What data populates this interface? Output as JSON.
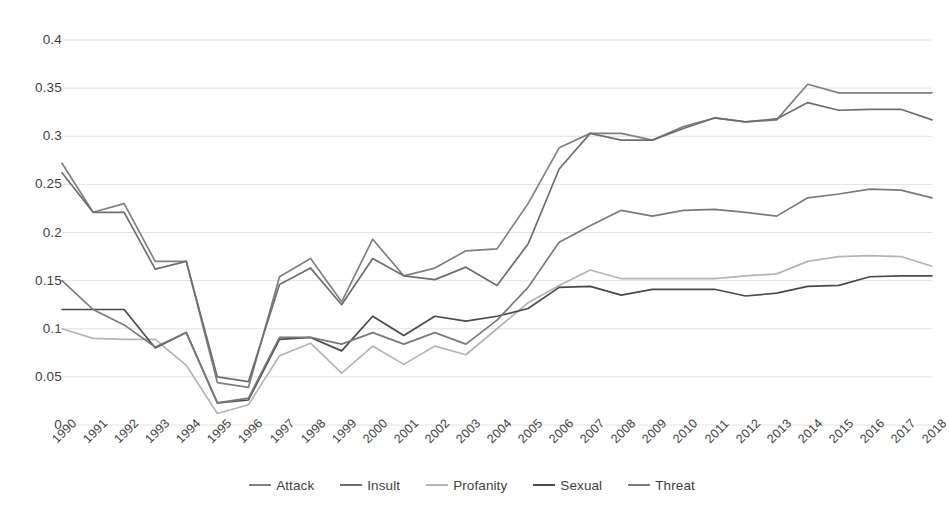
{
  "chart_data": {
    "type": "line",
    "title": "",
    "subtitle": "",
    "xlabel": "",
    "ylabel": "",
    "grid": true,
    "legend_position": "bottom",
    "xlim": [
      1990,
      2018
    ],
    "ylim": [
      0,
      0.4
    ],
    "ytick_labels": [
      "0",
      "0.05",
      "0.1",
      "0.15",
      "0.2",
      "0.25",
      "0.3",
      "0.35",
      "0.4"
    ],
    "ytick_values": [
      0,
      0.05,
      0.1,
      0.15,
      0.2,
      0.25,
      0.3,
      0.35,
      0.4
    ],
    "categories": [
      "1990",
      "1991",
      "1992",
      "1993",
      "1994",
      "1995",
      "1996",
      "1997",
      "1998",
      "1999",
      "2000",
      "2001",
      "2002",
      "2003",
      "2004",
      "2005",
      "2006",
      "2007",
      "2008",
      "2009",
      "2010",
      "2011",
      "2012",
      "2013",
      "2014",
      "2015",
      "2016",
      "2017",
      "2018"
    ],
    "series": [
      {
        "name": "Attack",
        "color": "#808080",
        "values": [
          0.272,
          0.221,
          0.23,
          0.17,
          0.17,
          0.044,
          0.039,
          0.154,
          0.173,
          0.128,
          0.193,
          0.155,
          0.163,
          0.181,
          0.183,
          0.23,
          0.288,
          0.303,
          0.303,
          0.296,
          0.31,
          0.319,
          0.315,
          0.317,
          0.354,
          0.345,
          0.345,
          0.345,
          0.345
        ]
      },
      {
        "name": "Insult",
        "color": "#6e6e6e",
        "values": [
          0.262,
          0.221,
          0.221,
          0.162,
          0.17,
          0.05,
          0.045,
          0.146,
          0.163,
          0.125,
          0.173,
          0.155,
          0.151,
          0.164,
          0.145,
          0.188,
          0.266,
          0.303,
          0.296,
          0.296,
          0.308,
          0.319,
          0.315,
          0.318,
          0.335,
          0.327,
          0.328,
          0.328,
          0.317
        ]
      },
      {
        "name": "Profanity",
        "color": "#b5b5b5",
        "values": [
          0.1,
          0.09,
          0.089,
          0.089,
          0.062,
          0.012,
          0.021,
          0.072,
          0.085,
          0.054,
          0.082,
          0.063,
          0.082,
          0.073,
          0.1,
          0.127,
          0.145,
          0.161,
          0.152,
          0.152,
          0.152,
          0.152,
          0.155,
          0.157,
          0.17,
          0.175,
          0.176,
          0.175,
          0.165
        ]
      },
      {
        "name": "Sexual",
        "color": "#4a4a4a",
        "values": [
          0.12,
          0.12,
          0.12,
          0.08,
          0.096,
          0.023,
          0.026,
          0.089,
          0.091,
          0.077,
          0.113,
          0.093,
          0.113,
          0.108,
          0.113,
          0.121,
          0.143,
          0.144,
          0.135,
          0.141,
          0.141,
          0.141,
          0.134,
          0.137,
          0.144,
          0.145,
          0.154,
          0.155,
          0.155
        ]
      },
      {
        "name": "Threat",
        "color": "#7a7a7a",
        "values": [
          0.15,
          0.12,
          0.104,
          0.081,
          0.096,
          0.023,
          0.028,
          0.091,
          0.091,
          0.084,
          0.096,
          0.084,
          0.096,
          0.084,
          0.109,
          0.143,
          0.19,
          0.207,
          0.223,
          0.217,
          0.223,
          0.224,
          0.221,
          0.217,
          0.236,
          0.24,
          0.245,
          0.244,
          0.236
        ]
      }
    ]
  },
  "legend": {
    "items": [
      {
        "label": "Attack",
        "color": "#808080"
      },
      {
        "label": "Insult",
        "color": "#6e6e6e"
      },
      {
        "label": "Profanity",
        "color": "#b5b5b5"
      },
      {
        "label": "Sexual",
        "color": "#4a4a4a"
      },
      {
        "label": "Threat",
        "color": "#7a7a7a"
      }
    ]
  },
  "colors": {
    "background": "#ffffff",
    "gridline": "#e2e2e2",
    "axis_text": "#3f3f3f"
  }
}
